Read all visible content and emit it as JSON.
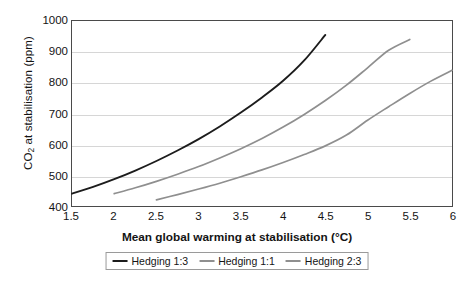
{
  "chart_data": {
    "type": "line",
    "title": "",
    "xlabel": "Mean global warming at stabilisation (°C)",
    "ylabel_prefix": "CO",
    "ylabel_sub": "2",
    "ylabel_suffix": " at stabilisation (ppm)",
    "ylabel": "CO2 at stabilisation (ppm)",
    "xlim": [
      1.5,
      6
    ],
    "ylim": [
      400,
      1000
    ],
    "xticks": [
      "1.5",
      "2",
      "2.5",
      "3",
      "3.5",
      "4",
      "4.5",
      "5",
      "5.5",
      "6"
    ],
    "xtick_values": [
      1.5,
      2,
      2.5,
      3,
      3.5,
      4,
      4.5,
      5,
      5.5,
      6
    ],
    "yticks": [
      "400",
      "500",
      "600",
      "700",
      "800",
      "900",
      "1000"
    ],
    "ytick_values": [
      400,
      500,
      600,
      700,
      800,
      900,
      1000
    ],
    "gridlines": [
      500,
      600,
      700,
      800,
      900
    ],
    "grid": true,
    "legend_position": "bottom",
    "series": [
      {
        "name": "Hedging 1:3",
        "color": "#1c1c1c",
        "x": [
          1.5,
          1.75,
          2.0,
          2.25,
          2.5,
          2.75,
          3.0,
          3.25,
          3.5,
          3.75,
          4.0,
          4.25,
          4.5
        ],
        "y": [
          440,
          462,
          487,
          515,
          546,
          580,
          617,
          658,
          703,
          752,
          806,
          872,
          955
        ]
      },
      {
        "name": "Hedging 1:1",
        "color": "#8f8f8f",
        "x": [
          2.0,
          2.25,
          2.5,
          2.75,
          3.0,
          3.25,
          3.5,
          3.75,
          4.0,
          4.25,
          4.5,
          4.75,
          5.0,
          5.25,
          5.5
        ],
        "y": [
          440,
          459,
          480,
          503,
          528,
          556,
          586,
          619,
          656,
          697,
          742,
          792,
          848,
          905,
          940
        ]
      },
      {
        "name": "Hedging 2:3",
        "color": "#8f8f8f",
        "x": [
          2.5,
          2.75,
          3.0,
          3.25,
          3.5,
          3.75,
          4.0,
          4.25,
          4.5,
          4.75,
          5.0,
          5.25,
          5.5,
          5.75,
          6.0
        ],
        "y": [
          420,
          437,
          455,
          474,
          495,
          517,
          541,
          567,
          595,
          630,
          678,
          722,
          765,
          805,
          840
        ]
      }
    ]
  },
  "legend": {
    "items": [
      {
        "label": "Hedging 1:3"
      },
      {
        "label": "Hedging 1:1"
      },
      {
        "label": "Hedging 2:3"
      }
    ]
  }
}
